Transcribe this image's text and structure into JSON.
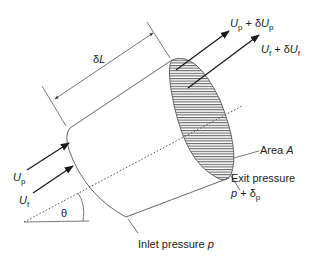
{
  "diagram": {
    "type": "inclined-pipe-element",
    "labels": {
      "length": {
        "prefix": "δ",
        "var": "L"
      },
      "exit_particle_velocity": {
        "var": "U",
        "sub": "p",
        "op": " + δ",
        "var2": "U",
        "sub2": "p"
      },
      "exit_fluid_velocity": {
        "var": "U",
        "sub": "f",
        "op": " + δ",
        "var2": "U",
        "sub2": "f"
      },
      "inlet_particle_velocity": {
        "var": "U",
        "sub": "p"
      },
      "inlet_fluid_velocity": {
        "var": "U",
        "sub": "f"
      },
      "angle": "θ",
      "area": {
        "text": "Area ",
        "var": "A"
      },
      "exit_pressure_title": "Exit pressure",
      "exit_pressure_value": {
        "var": "p",
        "op": " + δ",
        "sub": "p"
      },
      "inlet_pressure": {
        "text": "Inlet pressure ",
        "var": "p"
      }
    },
    "colors": {
      "stroke": "#555555",
      "arrow": "#1a1a1a",
      "text": "#222222"
    }
  }
}
